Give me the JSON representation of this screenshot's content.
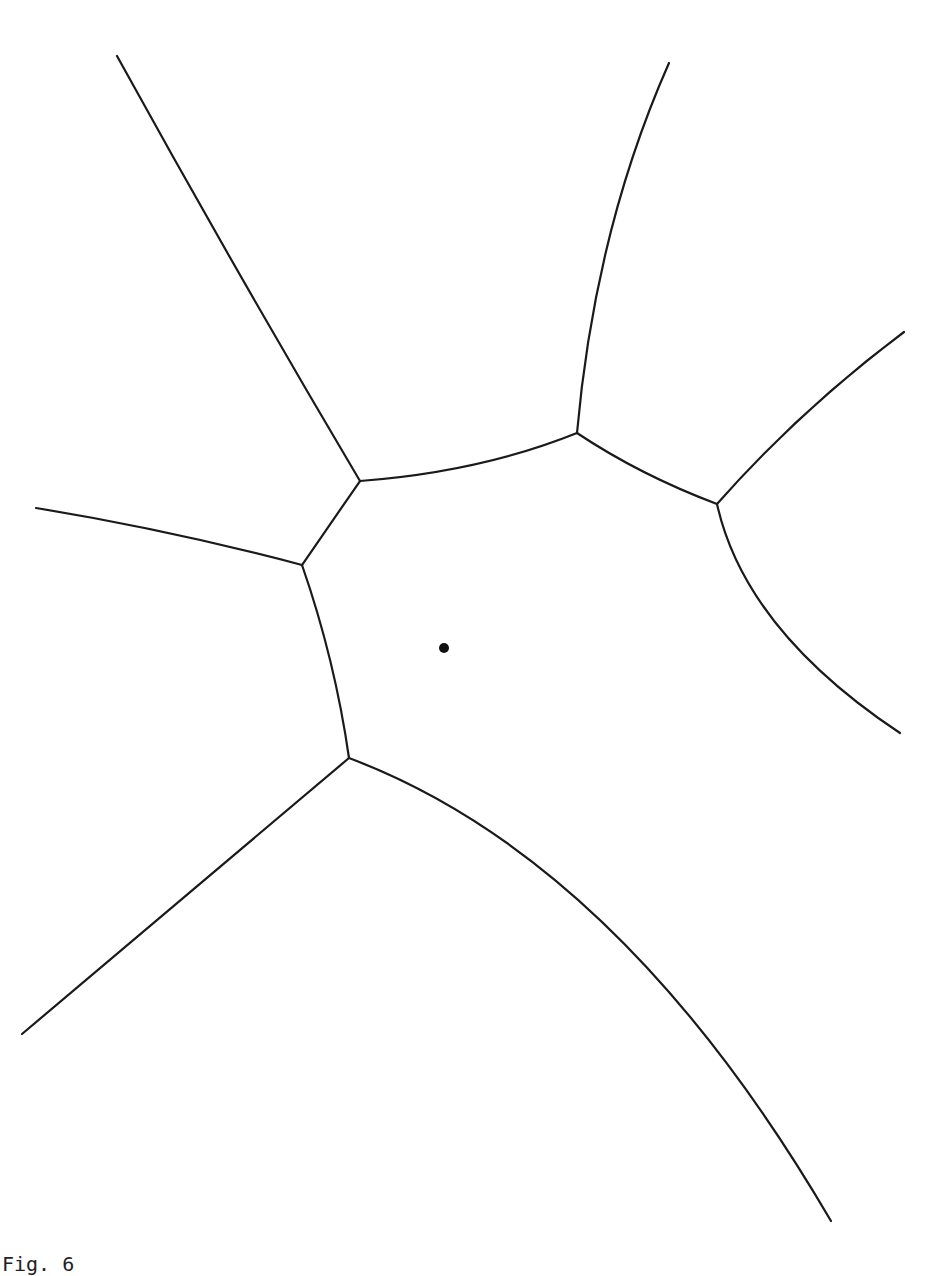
{
  "figure": {
    "caption": "Fig. 6",
    "stroke_color": "#1a1a1a",
    "background": "#ffffff",
    "site": {
      "cx": 444,
      "cy": 648,
      "r": 5
    },
    "vertices": {
      "A": [
        360,
        481
      ],
      "B": [
        302,
        565
      ],
      "C": [
        577,
        433
      ],
      "D": [
        717,
        504
      ],
      "E": [
        349,
        758
      ]
    },
    "edges": [
      {
        "id": "edge-top-left-ray",
        "from": "A",
        "to": "open",
        "d": "M360,481 Q235,270 117,56"
      },
      {
        "id": "edge-a-c",
        "from": "A",
        "to": "C",
        "d": "M360,481 Q480,472 577,433"
      },
      {
        "id": "edge-top-ray",
        "from": "C",
        "to": "open",
        "d": "M577,433 Q595,230 669,63"
      },
      {
        "id": "edge-c-d",
        "from": "C",
        "to": "D",
        "d": "M577,433 Q640,475 717,504"
      },
      {
        "id": "edge-right-upper-ray",
        "from": "D",
        "to": "open",
        "d": "M717,504 Q800,410 904,332"
      },
      {
        "id": "edge-right-lower-ray",
        "from": "D",
        "to": "open",
        "d": "M717,504 Q745,630 900,733"
      },
      {
        "id": "edge-a-b",
        "from": "A",
        "to": "B",
        "d": "M360,481 L302,565"
      },
      {
        "id": "edge-left-ray",
        "from": "B",
        "to": "open",
        "d": "M302,565 Q170,530 36,508"
      },
      {
        "id": "edge-b-e",
        "from": "B",
        "to": "E",
        "d": "M302,565 Q335,660 349,758"
      },
      {
        "id": "edge-bottom-left-ray",
        "from": "E",
        "to": "open",
        "d": "M349,758 L22,1034"
      },
      {
        "id": "edge-bottom-right-ray",
        "from": "E",
        "to": "open",
        "d": "M349,758 Q620,860 831,1221"
      }
    ]
  }
}
